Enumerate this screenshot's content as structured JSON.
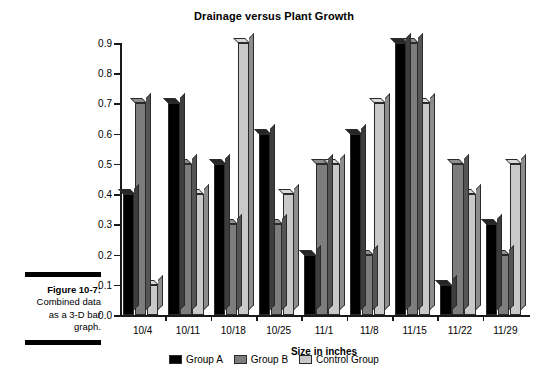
{
  "figure": {
    "caption_label": "Figure 10-7:",
    "caption_body": "Combined data as a 3-D bar graph."
  },
  "chart_data": {
    "type": "bar",
    "title": "Drainage versus Plant Growth",
    "xlabel": "Size in inches",
    "ylabel": "",
    "categories": [
      "10/4",
      "10/11",
      "10/18",
      "10/25",
      "11/1",
      "11/8",
      "11/15",
      "11/22",
      "11/29"
    ],
    "series": [
      {
        "name": "Group A",
        "color": "#000000",
        "values": [
          0.4,
          0.7,
          0.5,
          0.6,
          0.2,
          0.6,
          0.9,
          0.1,
          0.3
        ]
      },
      {
        "name": "Group B",
        "color": "#7d7d7d",
        "values": [
          0.7,
          0.5,
          0.3,
          0.3,
          0.5,
          0.2,
          0.9,
          0.5,
          0.2
        ]
      },
      {
        "name": "Control Group",
        "color": "#c9c9c9",
        "values": [
          0.1,
          0.4,
          0.9,
          0.4,
          0.5,
          0.7,
          0.7,
          0.4,
          0.5
        ]
      }
    ],
    "ylim": [
      0.0,
      0.9
    ],
    "yticks": [
      "0.0",
      "0.1",
      "0.2",
      "0.3",
      "0.4",
      "0.5",
      "0.6",
      "0.7",
      "0.8",
      "0.9"
    ],
    "grid": false,
    "legend_position": "bottom",
    "style": "3-D bar"
  }
}
